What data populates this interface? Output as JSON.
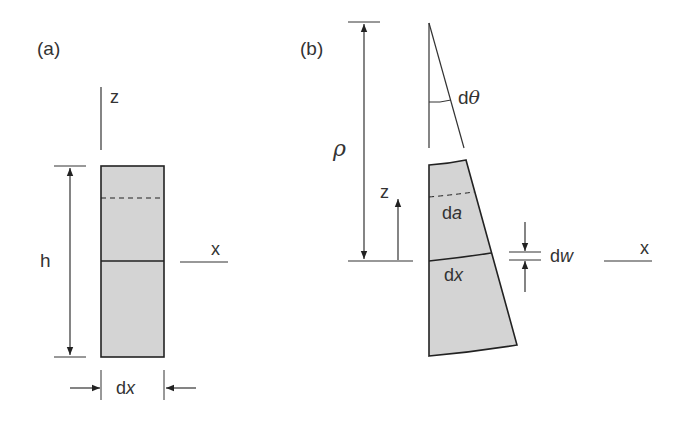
{
  "figure": {
    "colors": {
      "fill": "#d4d4d4",
      "stroke": "#222222",
      "line": "#333333",
      "background": "#ffffff"
    },
    "panel_a": {
      "label": "(a)",
      "z_axis": "z",
      "x_axis": "x",
      "height_label": "h",
      "width_label_prefix": "d",
      "width_label_var": "x"
    },
    "panel_b": {
      "label": "(b)",
      "radius_label": "ρ",
      "angle_prefix": "d",
      "angle_var": "θ",
      "z_axis": "z",
      "x_axis": "x",
      "area_prefix": "d",
      "area_var": "a",
      "length_prefix": "d",
      "length_var": "x",
      "deflection_prefix": "d",
      "deflection_var": "w"
    }
  }
}
